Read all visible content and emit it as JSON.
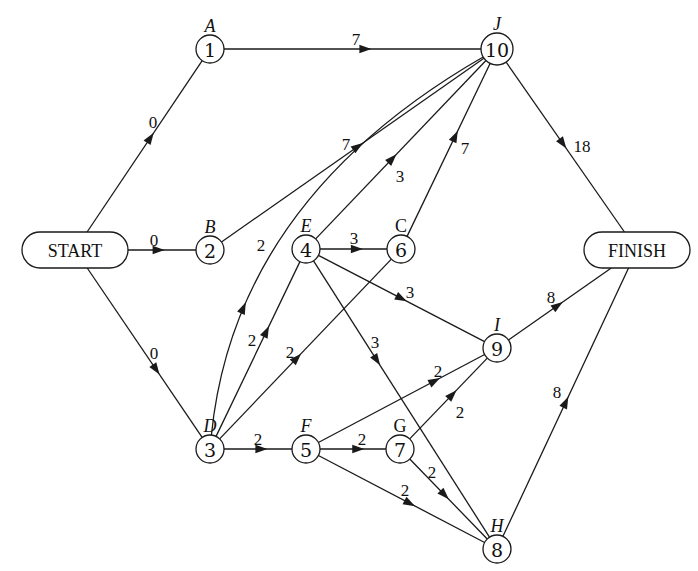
{
  "diagram": {
    "type": "activity-network",
    "terminals": [
      {
        "id": "start",
        "label": "START",
        "x": 75,
        "y": 250,
        "w": 106,
        "h": 36
      },
      {
        "id": "finish",
        "label": "FINISH",
        "x": 637,
        "y": 250,
        "w": 106,
        "h": 36
      }
    ],
    "nodes": [
      {
        "id": "1",
        "number": "1",
        "letter": "A",
        "x": 210,
        "y": 49
      },
      {
        "id": "2",
        "number": "2",
        "letter": "B",
        "x": 210,
        "y": 250
      },
      {
        "id": "3",
        "number": "3",
        "letter": "D",
        "x": 210,
        "y": 449
      },
      {
        "id": "4",
        "number": "4",
        "letter": "E",
        "x": 306,
        "y": 249
      },
      {
        "id": "5",
        "number": "5",
        "letter": "F",
        "x": 306,
        "y": 449
      },
      {
        "id": "6",
        "number": "6",
        "letter": "C",
        "x": 401,
        "y": 249,
        "upright": true
      },
      {
        "id": "7",
        "number": "7",
        "letter": "G",
        "x": 400,
        "y": 449,
        "upright": true
      },
      {
        "id": "8",
        "number": "8",
        "letter": "H",
        "x": 497,
        "y": 549
      },
      {
        "id": "9",
        "number": "9",
        "letter": "I",
        "x": 497,
        "y": 348
      },
      {
        "id": "10",
        "number": "10",
        "letter": "J",
        "x": 497,
        "y": 49
      }
    ],
    "edges": [
      {
        "from": "start",
        "to": "1",
        "weight": "0",
        "label_x": 153,
        "label_y": 122,
        "arrow_t": 0.55
      },
      {
        "from": "start",
        "to": "2",
        "weight": "0",
        "label_x": 154,
        "label_y": 240,
        "arrow_t": 0.45
      },
      {
        "from": "start",
        "to": "3",
        "weight": "0",
        "label_x": 154,
        "label_y": 353,
        "arrow_t": 0.6
      },
      {
        "from": "1",
        "to": "10",
        "weight": "7",
        "label_x": 356,
        "label_y": 39,
        "arrow_t": 0.55
      },
      {
        "from": "2",
        "to": "10",
        "weight": "7",
        "label_x": 346,
        "label_y": 144,
        "arrow_t": 0.52
      },
      {
        "from": "3",
        "to": "10",
        "weight": "2",
        "label_x": 261,
        "label_y": 245,
        "arrow_t": 0.3,
        "curve": true,
        "cx": 235,
        "cy": 200
      },
      {
        "from": "4",
        "to": "10",
        "weight": "3",
        "label_x": 400,
        "label_y": 176,
        "arrow_t": 0.45
      },
      {
        "from": "6",
        "to": "10",
        "weight": "7",
        "label_x": 465,
        "label_y": 148,
        "arrow_t": 0.58
      },
      {
        "from": "10",
        "to": "finish",
        "weight": "18",
        "label_x": 582,
        "label_y": 146,
        "arrow_t": 0.48
      },
      {
        "from": "4",
        "to": "6",
        "weight": "3",
        "label_x": 354,
        "label_y": 238,
        "arrow_t": 0.55
      },
      {
        "from": "3",
        "to": "4",
        "weight": "2",
        "label_x": 252,
        "label_y": 340,
        "arrow_t": 0.6
      },
      {
        "from": "3",
        "to": "6",
        "weight": "2",
        "label_x": 290,
        "label_y": 352,
        "arrow_t": 0.45
      },
      {
        "from": "4",
        "to": "9",
        "weight": "3",
        "label_x": 410,
        "label_y": 292,
        "arrow_t": 0.5
      },
      {
        "from": "4",
        "to": "8",
        "weight": "3",
        "label_x": 375,
        "label_y": 342,
        "arrow_t": 0.36
      },
      {
        "from": "3",
        "to": "5",
        "weight": "2",
        "label_x": 258,
        "label_y": 439,
        "arrow_t": 0.55
      },
      {
        "from": "5",
        "to": "7",
        "weight": "2",
        "label_x": 362,
        "label_y": 439,
        "arrow_t": 0.58
      },
      {
        "from": "5",
        "to": "9",
        "weight": "2",
        "label_x": 438,
        "label_y": 371,
        "arrow_t": 0.7
      },
      {
        "from": "7",
        "to": "9",
        "weight": "2",
        "label_x": 460,
        "label_y": 412,
        "arrow_t": 0.55
      },
      {
        "from": "7",
        "to": "8",
        "weight": "2",
        "label_x": 432,
        "label_y": 472,
        "arrow_t": 0.45
      },
      {
        "from": "5",
        "to": "8",
        "weight": "2",
        "label_x": 405,
        "label_y": 490,
        "arrow_t": 0.55
      },
      {
        "from": "9",
        "to": "finish",
        "weight": "8",
        "label_x": 551,
        "label_y": 297,
        "arrow_t": 0.48
      },
      {
        "from": "8",
        "to": "finish",
        "weight": "8",
        "label_x": 557,
        "label_y": 392,
        "arrow_t": 0.5
      }
    ]
  }
}
